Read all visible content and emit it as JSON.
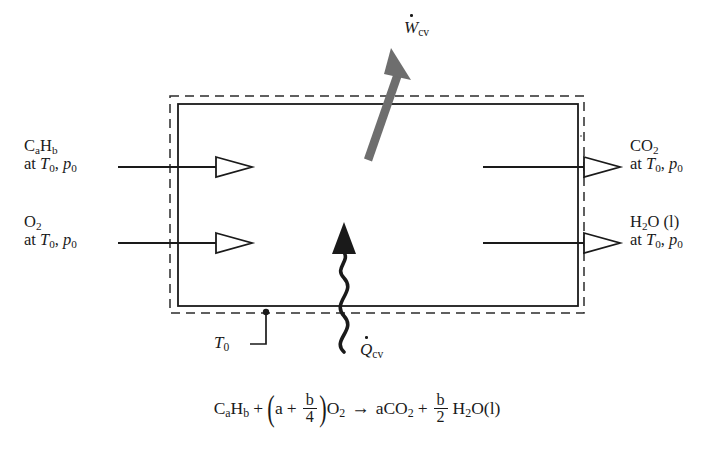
{
  "figure": {
    "type": "thermodynamic-control-volume-diagram"
  },
  "control_volume": {
    "boundary_label": "T0",
    "boundary_style": "dashed-outer-with-solid-inner-rectangle"
  },
  "inlets": [
    {
      "id": "fuel",
      "species_line": "CaHb",
      "state_line": "at T0, p0",
      "species_parts": {
        "c": "C",
        "a": "a",
        "h": "H",
        "b": "b"
      },
      "state_parts": {
        "at": "at ",
        "t": "T",
        "t_sub": "0",
        "comma": ", ",
        "p": "p",
        "p_sub": "0"
      }
    },
    {
      "id": "oxygen",
      "species_line": "O2",
      "state_line": "at T0, p0",
      "species_parts": {
        "sym": "O",
        "sub": "2"
      },
      "state_parts": {
        "at": "at ",
        "t": "T",
        "t_sub": "0",
        "comma": ", ",
        "p": "p",
        "p_sub": "0"
      }
    }
  ],
  "outlets": [
    {
      "id": "carbon-dioxide",
      "species_line": "CO2",
      "state_line": "at T0, p0",
      "species_parts": {
        "sym": "CO",
        "sub": "2"
      },
      "state_parts": {
        "at": "at ",
        "t": "T",
        "t_sub": "0",
        "comma": ", ",
        "p": "p",
        "p_sub": "0"
      }
    },
    {
      "id": "water-liquid",
      "species_line": "H2O (l)",
      "state_line": "at T0, p0",
      "species_parts": {
        "h": "H",
        "sub": "2",
        "o": "O",
        "phase": " (l)"
      },
      "state_parts": {
        "at": "at ",
        "t": "T",
        "t_sub": "0",
        "comma": ", ",
        "p": "p",
        "p_sub": "0"
      }
    }
  ],
  "energy_transfers": {
    "work": {
      "id": "w-cv",
      "symbol": "W",
      "subscript": "cv",
      "label": "Wcv",
      "direction": "out-upper-right",
      "arrow_style": "thick-straight-gray",
      "color": "#6e6e6e"
    },
    "heat": {
      "id": "q-cv",
      "symbol": "Q",
      "subscript": "cv",
      "label": "Qcv",
      "direction": "in-from-below",
      "arrow_style": "wavy-black",
      "color": "#1a1a1a"
    }
  },
  "equation": {
    "fuel": {
      "c": "C",
      "a": "a",
      "h": "H",
      "b": "b"
    },
    "plus1": "+",
    "paren_open": "(",
    "coef_a": "a",
    "plus_inner": "+",
    "frac1": {
      "num": "b",
      "den": "4"
    },
    "paren_close": ")",
    "o2": {
      "sym": "O",
      "sub": "2"
    },
    "arrow": "→",
    "co2": {
      "coef": "a",
      "sym": "CO",
      "sub": "2"
    },
    "plus2": "+",
    "frac2": {
      "num": "b",
      "den": "2"
    },
    "h2o": {
      "h": "H",
      "sub": "2",
      "o": "O",
      "phase": "(l)"
    },
    "plain_text": "CaHb + (a + b/4)O2 -> aCO2 + (b/2) H2O(l)"
  },
  "colors": {
    "line": "#1a1a1a",
    "work_arrow": "#6e6e6e",
    "background": "#ffffff"
  }
}
